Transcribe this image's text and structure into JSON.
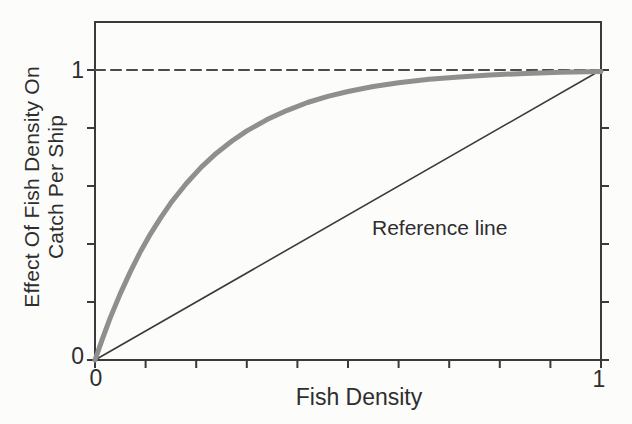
{
  "figure": {
    "background": "#fcfcfb",
    "axis_color": "#3a3a3a",
    "text_color": "#2e2e2e",
    "grid": "off",
    "legend": "none"
  },
  "chart_data": {
    "type": "line",
    "title": "",
    "xlabel": "Fish Density",
    "ylabel": "Effect Of Fish Density On Catch Per Ship",
    "ylabel_lines": [
      "Effect Of Fish Density On",
      "Catch Per Ship"
    ],
    "xlim": [
      0,
      1
    ],
    "ylim": [
      0,
      1.17
    ],
    "x_tick_step": 0.1,
    "y_tick_step": 0.2,
    "x_tick_labels": [
      {
        "value": 0,
        "text": "0"
      },
      {
        "value": 1,
        "text": "1"
      }
    ],
    "y_tick_labels": [
      {
        "value": 0,
        "text": "0"
      },
      {
        "value": 1,
        "text": "1"
      }
    ],
    "series": [
      {
        "name": "saturation-dashed-line",
        "style": "dashed",
        "color": "#4a4a4a",
        "points": [
          [
            0,
            1
          ],
          [
            1,
            1
          ]
        ]
      },
      {
        "name": "reference-line",
        "style": "thin-solid",
        "color": "#3a3a3a",
        "points": [
          [
            0,
            0
          ],
          [
            1,
            1
          ]
        ]
      },
      {
        "name": "effect-curve",
        "style": "thick-gray",
        "color": "#8f8f8f",
        "points": [
          [
            0,
            0
          ],
          [
            0.015,
            0.075
          ],
          [
            0.03,
            0.145
          ],
          [
            0.05,
            0.229
          ],
          [
            0.07,
            0.305
          ],
          [
            0.09,
            0.374
          ],
          [
            0.11,
            0.436
          ],
          [
            0.13,
            0.491
          ],
          [
            0.15,
            0.542
          ],
          [
            0.18,
            0.608
          ],
          [
            0.21,
            0.665
          ],
          [
            0.24,
            0.713
          ],
          [
            0.27,
            0.754
          ],
          [
            0.3,
            0.79
          ],
          [
            0.34,
            0.829
          ],
          [
            0.38,
            0.861
          ],
          [
            0.42,
            0.888
          ],
          [
            0.46,
            0.909
          ],
          [
            0.5,
            0.926
          ],
          [
            0.55,
            0.943
          ],
          [
            0.6,
            0.956
          ],
          [
            0.66,
            0.968
          ],
          [
            0.72,
            0.976
          ],
          [
            0.78,
            0.983
          ],
          [
            0.85,
            0.988
          ],
          [
            0.92,
            0.992
          ],
          [
            1,
            0.995
          ]
        ]
      }
    ],
    "annotations": [
      {
        "text": "Reference line",
        "x": 0.55,
        "y": 0.43
      }
    ]
  }
}
